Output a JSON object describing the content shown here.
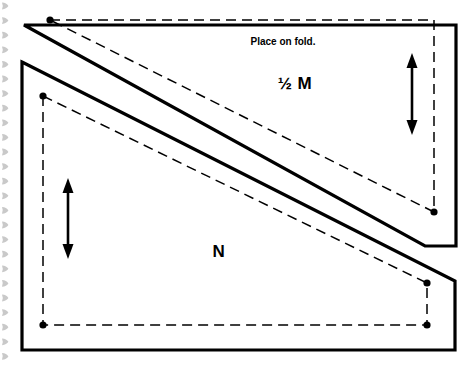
{
  "document": {
    "type": "sewing-pattern-template",
    "background_color": "#ffffff",
    "ink_color": "#000000",
    "binding_mark_color": "#c9c9c9"
  },
  "labels": {
    "fold_instruction": "Place on fold.",
    "piece_m": "½ M",
    "piece_m_fraction": "½",
    "piece_m_letter": "M",
    "piece_n": "N"
  },
  "pieces": [
    {
      "id": "piece-m",
      "name": "½ M",
      "cut_line_points": "24,25 456,25 456,246 425,246",
      "seam_line_points": "50,20 434,20 434,212",
      "grain_arrow": {
        "x": 412,
        "y_top": 57,
        "y_bottom": 131
      },
      "corner_dots": [
        {
          "x": 50,
          "y": 20
        },
        {
          "x": 434,
          "y": 212
        }
      ]
    },
    {
      "id": "piece-n",
      "name": "N",
      "cut_line_points": "22,62 455,281 455,350 22,350",
      "seam_line_points": "43,96 427,283 427,325 43,325",
      "grain_arrow": {
        "x": 68,
        "y_top": 181,
        "y_bottom": 256
      },
      "corner_dots": [
        {
          "x": 43,
          "y": 96
        },
        {
          "x": 427,
          "y": 283
        },
        {
          "x": 427,
          "y": 325
        },
        {
          "x": 43,
          "y": 325
        }
      ]
    }
  ],
  "diagonal_edges": {
    "m_lower_edge": "24,25 425,246",
    "n_upper_edge": "22,62 455,281",
    "m_seam_diagonal": "50,20 434,212",
    "n_seam_diagonal": "43,96 427,283"
  },
  "binding": {
    "mark_count": 25,
    "mark_x": 5,
    "mark_start_y": 6,
    "mark_spacing": 14.6
  }
}
